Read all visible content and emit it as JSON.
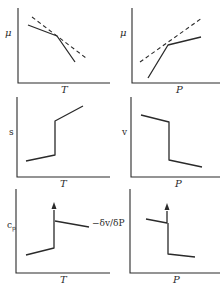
{
  "figure": {
    "panels": [
      {
        "id": "mu-vs-T",
        "ylabel": "μ",
        "xlabel": "T",
        "curves": [
          {
            "style": "solid",
            "points": [
              [
                28,
                25
              ],
              [
                57,
                36
              ],
              [
                75,
                62
              ]
            ]
          },
          {
            "style": "dashed",
            "points": [
              [
                32,
                17
              ],
              [
                86,
                58
              ]
            ]
          }
        ]
      },
      {
        "id": "mu-vs-P",
        "ylabel": "μ",
        "xlabel": "P",
        "curves": [
          {
            "style": "solid",
            "points": [
              [
                148,
                78
              ],
              [
                168,
                45
              ],
              [
                201,
                37
              ]
            ]
          },
          {
            "style": "dashed",
            "points": [
              [
                140,
                62
              ],
              [
                202,
                18
              ]
            ]
          }
        ]
      },
      {
        "id": "s-vs-T",
        "ylabel": "s",
        "xlabel": "T",
        "curves": [
          {
            "style": "solid",
            "points": [
              [
                26,
                161
              ],
              [
                55,
                155
              ],
              [
                55,
                121
              ],
              [
                83,
                106
              ]
            ]
          }
        ]
      },
      {
        "id": "v-vs-P",
        "ylabel": "v",
        "xlabel": "P",
        "curves": [
          {
            "style": "solid",
            "points": [
              [
                141,
                115
              ],
              [
                169,
                122
              ],
              [
                169,
                160
              ],
              [
                202,
                167
              ]
            ]
          }
        ]
      },
      {
        "id": "cp-vs-T",
        "ylabel": "c",
        "ylabel_sub": "p",
        "xlabel": "T",
        "curves": [
          {
            "style": "solid",
            "points": [
              [
                26,
                255
              ],
              [
                54,
                248
              ],
              [
                54,
                208
              ]
            ]
          },
          {
            "style": "solid",
            "points": [
              [
                55,
                221
              ],
              [
                89,
                227
              ]
            ]
          }
        ],
        "arrow": {
          "x": 54,
          "y_from": 212,
          "y_to": 203
        }
      },
      {
        "id": "compressibility-vs-P",
        "ylabel": "−δv/δP",
        "xlabel": "P",
        "curves": [
          {
            "style": "solid",
            "points": [
              [
                146,
                219
              ],
              [
                167,
                223
              ],
              [
                167,
                209
              ]
            ]
          },
          {
            "style": "solid",
            "points": [
              [
                168,
                223
              ],
              [
                168,
                254
              ],
              [
                195,
                257
              ]
            ]
          }
        ],
        "arrow": {
          "x": 167,
          "y_from": 213,
          "y_to": 204
        }
      }
    ]
  },
  "labels": {
    "p1_y": "μ",
    "p1_x": "T",
    "p2_y": "μ",
    "p2_x": "P",
    "p3_y": "s",
    "p3_x": "T",
    "p4_y": "v",
    "p4_x": "P",
    "p5_y": "c",
    "p5_y_sub": "p",
    "p5_x": "T",
    "p6_y": "−δv/δP",
    "p6_x": "P"
  }
}
